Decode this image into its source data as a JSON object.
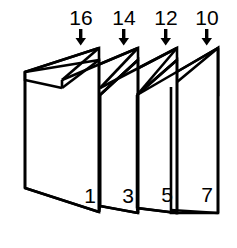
{
  "diagram": {
    "stroke_color": "#000000",
    "fill_color": "#ffffff",
    "background_color": "#ffffff",
    "top_labels": [
      {
        "value": "16",
        "arrow": "down-arrow-icon",
        "x": 81
      },
      {
        "value": "14",
        "arrow": "down-arrow-icon",
        "x": 124
      },
      {
        "value": "12",
        "arrow": "down-arrow-icon",
        "x": 166
      },
      {
        "value": "10",
        "arrow": "down-arrow-icon",
        "x": 207
      }
    ],
    "corner_labels": [
      {
        "value": "1",
        "x": 99,
        "y": 200
      },
      {
        "value": "3",
        "x": 143,
        "y": 198
      },
      {
        "value": "5",
        "x": 180,
        "y": 196
      },
      {
        "value": "7",
        "x": 212,
        "y": 195
      }
    ],
    "panels": [
      {
        "name": "panel-1",
        "front_number": "1",
        "top_number": "16"
      },
      {
        "name": "panel-2",
        "front_number": "3",
        "top_number": "14"
      },
      {
        "name": "panel-3",
        "front_number": "5",
        "top_number": "12"
      },
      {
        "name": "panel-4",
        "front_number": "7",
        "top_number": "10"
      }
    ]
  }
}
